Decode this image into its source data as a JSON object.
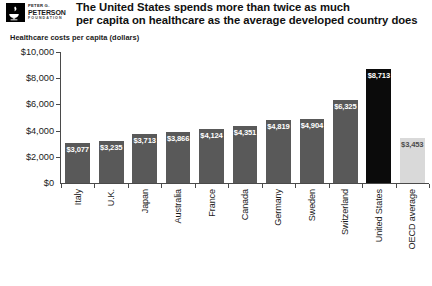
{
  "logo": {
    "icon": "peterson-foundation-logo",
    "line1": "PETER G.",
    "line2": "PETERSON",
    "line3": "FOUNDATION"
  },
  "headline": {
    "line1": "The United States spends more than twice as much",
    "line2": "per capita on healthcare as the average developed country does"
  },
  "chart_data": {
    "type": "bar",
    "title": "The United States spends more than twice as much per capita on healthcare as the average developed country does",
    "subtitle": "Healthcare costs per capita (dollars)",
    "xlabel": "",
    "ylabel": "Healthcare costs per capita (dollars)",
    "ylim": [
      0,
      10000
    ],
    "yticks": [
      0,
      2000,
      4000,
      6000,
      8000,
      10000
    ],
    "ytick_labels": [
      "$0",
      "$2,000",
      "$4,000",
      "$6,000",
      "$8,000",
      "$10,000"
    ],
    "grid": false,
    "legend": "none",
    "categories": [
      "Italy",
      "U.K.",
      "Japan",
      "Australia",
      "France",
      "Canada",
      "Germany",
      "Sweden",
      "Switzerland",
      "United States",
      "OECD average"
    ],
    "values": [
      3077,
      3235,
      3713,
      3866,
      4124,
      4351,
      4819,
      4904,
      6325,
      8713,
      3453
    ],
    "value_labels": [
      "$3,077",
      "$3,235",
      "$3,713",
      "$3,866",
      "$4,124",
      "$4,351",
      "$4,819",
      "$4,904",
      "$6,325",
      "$8,713",
      "$3,453"
    ],
    "bar_colors": [
      "#595959",
      "#595959",
      "#595959",
      "#595959",
      "#595959",
      "#595959",
      "#595959",
      "#595959",
      "#595959",
      "#0b0b0b",
      "#d9d9d9"
    ],
    "label_text_colors": [
      "#ffffff",
      "#ffffff",
      "#ffffff",
      "#ffffff",
      "#ffffff",
      "#ffffff",
      "#ffffff",
      "#ffffff",
      "#ffffff",
      "#ffffff",
      "#4d4d4d"
    ]
  }
}
